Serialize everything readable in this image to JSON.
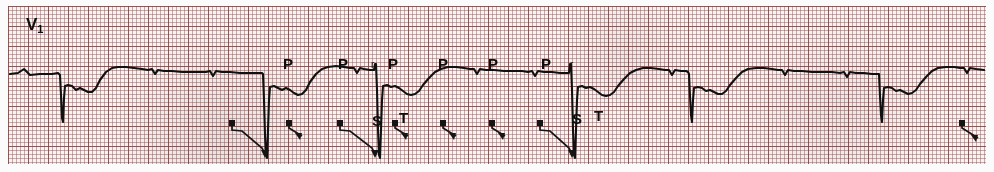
{
  "figure": {
    "type": "ecg-rhythm-strip",
    "width": 994,
    "height": 172,
    "lead_label": "V",
    "lead_subscript": "1",
    "paper_color": "#f7f3f1",
    "grid_color": "#7a4646",
    "trace_color": "#101010",
    "grid_small_px": 4,
    "grid_bold_px": 20
  },
  "annotations": {
    "p_waves": [
      {
        "label": "P",
        "x": 283,
        "y": 56
      },
      {
        "label": "P",
        "x": 338,
        "y": 56
      },
      {
        "label": "P",
        "x": 388,
        "y": 56
      },
      {
        "label": "P",
        "x": 438,
        "y": 56
      },
      {
        "label": "P",
        "x": 488,
        "y": 56
      },
      {
        "label": "P",
        "x": 541,
        "y": 56
      }
    ],
    "r_waves": [
      {
        "label": "r",
        "x": 371,
        "y": 60
      },
      {
        "label": "r",
        "x": 570,
        "y": 60
      }
    ],
    "s_waves": [
      {
        "label": "S",
        "x": 372,
        "y": 113
      },
      {
        "label": "S",
        "x": 572,
        "y": 111
      }
    ],
    "t_waves": [
      {
        "label": "T",
        "x": 399,
        "y": 110
      },
      {
        "label": "T",
        "x": 594,
        "y": 108
      }
    ]
  },
  "chart_data": {
    "type": "line",
    "title": "",
    "xlabel": "",
    "ylabel": "",
    "legend": [],
    "grid": true,
    "axis_ranges": {
      "x": [
        0,
        994
      ],
      "y": [
        172,
        0
      ]
    },
    "baseline_y": 74,
    "qrs_complexes": [
      {
        "index": 1,
        "x": 61,
        "nadir_y": 122,
        "type": "qS-deep"
      },
      {
        "index": 2,
        "x": 265,
        "nadir_y": 158,
        "type": "qS-deep"
      },
      {
        "index": 3,
        "x": 375,
        "nadir_y": 158,
        "type": "rS-deep"
      },
      {
        "index": 4,
        "x": 570,
        "nadir_y": 158,
        "type": "rS-deep"
      },
      {
        "index": 5,
        "x": 690,
        "nadir_y": 122,
        "type": "qS-deep"
      },
      {
        "index": 6,
        "x": 880,
        "nadir_y": 122,
        "type": "qS-deep"
      }
    ],
    "ladder_arrows": [
      {
        "id": "a1",
        "dot_x": 232,
        "dot_y": 123,
        "head_x": 265,
        "head_y": 158,
        "length": "long"
      },
      {
        "id": "a2",
        "dot_x": 289,
        "dot_y": 123,
        "head_x": 302,
        "head_y": 140,
        "length": "short"
      },
      {
        "id": "a3",
        "dot_x": 340,
        "dot_y": 123,
        "head_x": 375,
        "head_y": 158,
        "length": "long"
      },
      {
        "id": "a4",
        "dot_x": 395,
        "dot_y": 123,
        "head_x": 408,
        "head_y": 140,
        "length": "short"
      },
      {
        "id": "a5",
        "dot_x": 443,
        "dot_y": 123,
        "head_x": 456,
        "head_y": 140,
        "length": "short"
      },
      {
        "id": "a6",
        "dot_x": 492,
        "dot_y": 123,
        "head_x": 505,
        "head_y": 140,
        "length": "short"
      },
      {
        "id": "a7",
        "dot_x": 540,
        "dot_y": 123,
        "head_x": 572,
        "head_y": 158,
        "length": "long"
      },
      {
        "id": "a8",
        "dot_x": 962,
        "dot_y": 123,
        "head_x": 978,
        "head_y": 142,
        "length": "short"
      }
    ],
    "waveform_path": "M 10,74 L 18,73 L 24,69 L 30,75 L 40,74 L 52,74 L 58,73 L 60,75 L 61,95 L 62,118 L 63,122 L 64,98 L 65,86 L 68,85 L 72,86 L 76,90 L 80,88 L 84,90 L 88,92 L 92,92 L 96,88 L 100,80 L 106,72 L 112,68 L 118,67 L 126,67 L 134,68 L 142,69 L 148,70 L 152,69 L 155,74 L 158,70 L 164,71 L 172,71 L 182,72 L 192,72 L 200,72 L 206,72 L 210,71 L 213,76 L 216,71 L 222,72 L 230,72 L 240,73 L 250,73 L 258,73 L 262,73 L 263,74 L 264,100 L 265,135 L 266,155 L 267,158 L 268,130 L 269,100 L 270,87 L 274,86 L 278,88 L 282,90 L 286,88 L 290,90 L 294,93 L 298,95 L 302,94 L 306,90 L 310,82 L 316,74 L 322,69 L 328,67 L 336,66 L 344,67 L 350,68 L 354,68 L 357,73 L 360,68 L 364,69 L 370,70 L 374,70 L 375,64 L 376,64 L 377,90 L 378,130 L 379,155 L 380,158 L 381,130 L 382,100 L 383,86 L 387,85 L 391,87 L 395,86 L 399,88 L 403,91 L 407,94 L 411,95 L 415,94 L 419,91 L 423,85 L 429,78 L 435,72 L 441,69 L 448,67 L 456,67 L 464,68 L 470,69 L 474,69 L 477,74 L 480,69 L 486,70 L 494,70 L 504,71 L 514,71 L 522,71 L 528,72 L 532,71 L 535,76 L 538,71 L 544,72 L 552,72 L 560,73 L 566,73 L 569,73 L 570,64 L 571,64 L 572,90 L 573,130 L 574,155 L 575,158 L 576,130 L 577,100 L 578,87 L 582,86 L 586,88 L 590,87 L 594,89 L 598,92 L 602,95 L 606,96 L 610,95 L 614,92 L 618,86 L 624,79 L 630,73 L 636,70 L 643,68 L 651,68 L 659,69 L 665,70 L 669,70 L 672,75 L 675,70 L 681,71 L 686,71 L 688,72 L 689,74 L 690,96 L 691,115 L 692,122 L 693,100 L 694,88 L 698,87 L 702,88 L 706,91 L 710,90 L 714,92 L 718,94 L 722,94 L 726,91 L 730,85 L 736,78 L 742,72 L 748,69 L 756,68 L 764,68 L 772,69 L 778,70 L 782,70 L 785,75 L 788,70 L 794,71 L 802,71 L 812,72 L 822,72 L 832,72 L 840,73 L 844,72 L 847,77 L 850,72 L 856,73 L 864,73 L 872,74 L 878,74 L 879,74 L 880,96 L 881,115 L 882,122 L 883,100 L 884,88 L 888,87 L 892,88 L 896,91 L 900,90 L 904,92 L 908,94 L 912,93 L 916,90 L 920,84 L 926,77 L 932,71 L 938,68 L 946,67 L 954,67 L 960,68 L 964,68 L 967,73 L 970,68 L 976,69 L 984,70"
  }
}
